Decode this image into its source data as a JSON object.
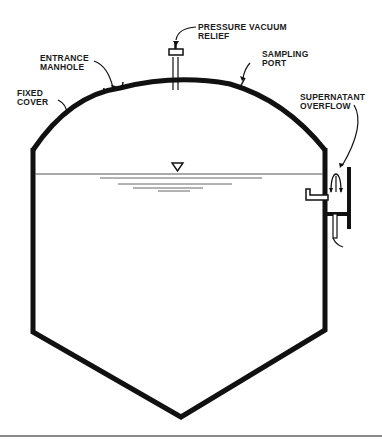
{
  "diagram": {
    "type": "tank-cross-section",
    "colors": {
      "stroke": "#111111",
      "water_lines": "#555555",
      "footer_rule": "#8a8a8a",
      "background": "#ffffff"
    },
    "labels": {
      "pressure_relief": {
        "line1": "PRESSURE VACUUM",
        "line2": "RELIEF"
      },
      "entrance_manhole": {
        "line1": "ENTRANCE",
        "line2": "MANHOLE"
      },
      "sampling_port": {
        "line1": "SAMPLING",
        "line2": "PORT"
      },
      "fixed_cover": {
        "line1": "FIXED",
        "line2": "COVER"
      },
      "supernatant_overflow": {
        "line1": "SUPERNATANT",
        "line2": "OVERFLOW"
      }
    },
    "symbols": {
      "water_level": "water-level-triangle"
    }
  }
}
